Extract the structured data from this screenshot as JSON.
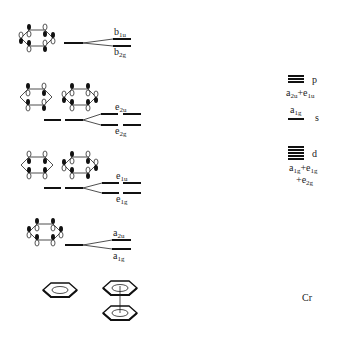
{
  "ligand_orbitals": [
    {
      "id": "b",
      "upper": {
        "base": "b",
        "sub": "1u"
      },
      "lower": {
        "base": "b",
        "sub": "2g"
      }
    },
    {
      "id": "e2",
      "upper": {
        "base": "e",
        "sub": "2u"
      },
      "lower": {
        "base": "e",
        "sub": "2g"
      }
    },
    {
      "id": "e1",
      "upper": {
        "base": "e",
        "sub": "1u"
      },
      "lower": {
        "base": "e",
        "sub": "1g"
      }
    },
    {
      "id": "a",
      "upper": {
        "base": "a",
        "sub": "2u"
      },
      "lower": {
        "base": "a",
        "sub": "1g"
      }
    }
  ],
  "metal": {
    "name": "Cr",
    "p": {
      "label": "p",
      "symmetry": [
        {
          "base": "a",
          "sub": "2u"
        },
        {
          "text": "+"
        },
        {
          "base": "e",
          "sub": "1u"
        }
      ]
    },
    "s": {
      "label": "s",
      "symmetry": {
        "base": "a",
        "sub": "1g"
      }
    },
    "d": {
      "label": "d",
      "symmetry_line1": [
        {
          "base": "a",
          "sub": "1g"
        },
        {
          "text": "+"
        },
        {
          "base": "e",
          "sub": "1g"
        }
      ],
      "symmetry_line2": [
        {
          "text": "+"
        },
        {
          "base": "e",
          "sub": "2g"
        }
      ]
    }
  },
  "bottom": {
    "benzene": "benzene",
    "dimer": "bis(benzene)"
  },
  "colors": {
    "line": "#111111",
    "text": "#222222",
    "background": "#ffffff"
  }
}
